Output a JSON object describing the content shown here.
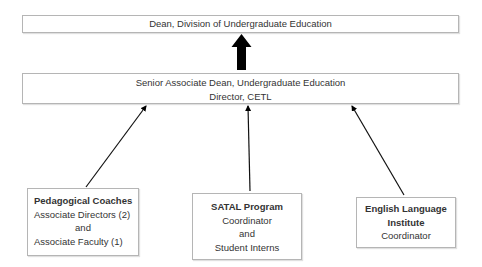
{
  "diagram": {
    "type": "org-chart",
    "top_node": {
      "title": "Dean, Division of Undergraduate Education"
    },
    "middle_node": {
      "line1": "Senior Associate Dean, Undergraduate Education",
      "line2": "Director, CETL"
    },
    "children": [
      {
        "title": "Pedagogical Coaches",
        "line1": "Associate Directors (2)",
        "line2": "and",
        "line3": "Associate Faculty (1)"
      },
      {
        "title": "SATAL Program",
        "line1": "Coordinator",
        "line2": "and",
        "line3": "Student Interns"
      },
      {
        "title_line1": "English Language",
        "title_line2": "Institute",
        "line1": "Coordinator"
      }
    ],
    "edges": [
      {
        "from": "middle_node",
        "to": "top_node",
        "style": "thick-block-arrow"
      },
      {
        "from": "children.0",
        "to": "middle_node",
        "style": "thin-arrow"
      },
      {
        "from": "children.1",
        "to": "middle_node",
        "style": "thin-arrow"
      },
      {
        "from": "children.2",
        "to": "middle_node",
        "style": "thin-arrow"
      }
    ],
    "colors": {
      "box_border": "#b5b5b5",
      "arrow": "#000000",
      "text": "#333333"
    }
  }
}
